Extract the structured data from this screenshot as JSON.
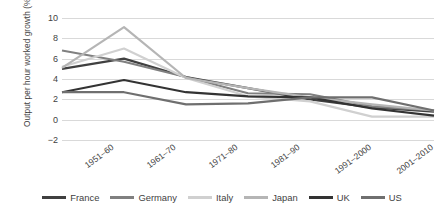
{
  "chart_data": {
    "type": "line",
    "title": "",
    "xlabel": "",
    "ylabel": "Output per hour worked growth (% p.a.)",
    "ylim": [
      -2,
      10
    ],
    "yticks": [
      10,
      8,
      6,
      4,
      2,
      0,
      -2
    ],
    "ytick_labels": [
      "10",
      "8",
      "6",
      "4",
      "2",
      "0",
      "−2"
    ],
    "grid": true,
    "legend_position": "bottom",
    "categories": [
      "1951–60",
      "1961–70",
      "1971–80",
      "1981–90",
      "1991–2000",
      "2001–2010",
      "2011–2019"
    ],
    "series": [
      {
        "name": "France",
        "color": "#404040",
        "values": [
          5.0,
          6.0,
          4.2,
          3.1,
          2.0,
          1.2,
          0.8
        ]
      },
      {
        "name": "Germany",
        "color": "#808080",
        "values": [
          6.8,
          5.7,
          4.2,
          2.6,
          2.5,
          1.3,
          0.9
        ]
      },
      {
        "name": "Italy",
        "color": "#d0d0d0",
        "values": [
          5.2,
          7.0,
          4.1,
          2.3,
          1.8,
          0.3,
          0.3
        ]
      },
      {
        "name": "Japan",
        "color": "#b5b5b5",
        "values": [
          5.1,
          9.1,
          4.1,
          3.1,
          2.2,
          1.5,
          0.9
        ]
      },
      {
        "name": "UK",
        "color": "#333333",
        "values": [
          2.7,
          3.9,
          2.7,
          2.3,
          2.2,
          1.1,
          0.4
        ]
      },
      {
        "name": "US",
        "color": "#6f6f6f",
        "values": [
          2.7,
          2.7,
          1.5,
          1.6,
          2.2,
          2.2,
          0.9
        ]
      }
    ]
  },
  "legend": {
    "items": [
      {
        "label": "France"
      },
      {
        "label": "Germany"
      },
      {
        "label": "Italy"
      },
      {
        "label": "Japan"
      },
      {
        "label": "UK"
      },
      {
        "label": "US"
      }
    ]
  }
}
